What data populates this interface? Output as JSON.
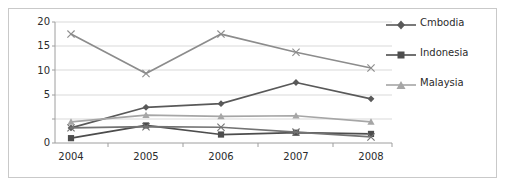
{
  "chart_data": {
    "type": "line",
    "title": "",
    "xlabel": "",
    "ylabel": "",
    "categories": [
      "2004",
      "2005",
      "2006",
      "2007",
      "2008"
    ],
    "ylim": [
      0,
      20
    ],
    "yticks": [
      0,
      5,
      10,
      15,
      20
    ],
    "grid": true,
    "legend_position": "right",
    "series": [
      {
        "name": "series-x-upper",
        "legend_label": null,
        "marker": "x",
        "color": "#8c8c8c",
        "values": [
          18.0,
          11.5,
          18.0,
          15.0,
          12.4
        ]
      },
      {
        "name": "Cmbodia",
        "legend_label": "Cmbodia",
        "marker": "diamond",
        "color": "#595959",
        "values": [
          2.5,
          5.9,
          6.5,
          10.0,
          7.3
        ]
      },
      {
        "name": "Indonesia",
        "legend_label": "Indonesia",
        "marker": "square",
        "color": "#4d4d4d",
        "values": [
          0.8,
          2.9,
          1.4,
          1.7,
          1.5
        ]
      },
      {
        "name": "Malaysia",
        "legend_label": "Malaysia",
        "marker": "triangle",
        "color": "#a6a6a6",
        "values": [
          3.5,
          4.6,
          4.4,
          4.5,
          3.5
        ]
      },
      {
        "name": "series-x-lower",
        "legend_label": null,
        "marker": "x",
        "color": "#737373",
        "values": [
          2.5,
          2.7,
          2.6,
          1.8,
          1.0
        ]
      }
    ]
  },
  "axes": {
    "y_tick_labels": [
      "20",
      "15",
      "10",
      "5",
      "0"
    ],
    "x_tick_labels": [
      "2004",
      "2005",
      "2006",
      "2007",
      "2008"
    ]
  },
  "legend": {
    "entries": [
      {
        "label": "Cmbodia",
        "marker": "diamond",
        "color": "#595959"
      },
      {
        "label": "Indonesia",
        "marker": "square",
        "color": "#4d4d4d"
      },
      {
        "label": "Malaysia",
        "marker": "triangle",
        "color": "#a6a6a6"
      }
    ]
  },
  "colors": {
    "frame": "#c9c9c9",
    "gridline": "#d9d9d9",
    "axis": "#9e9e9e",
    "text": "#2b2b2b",
    "background": "#ffffff"
  }
}
